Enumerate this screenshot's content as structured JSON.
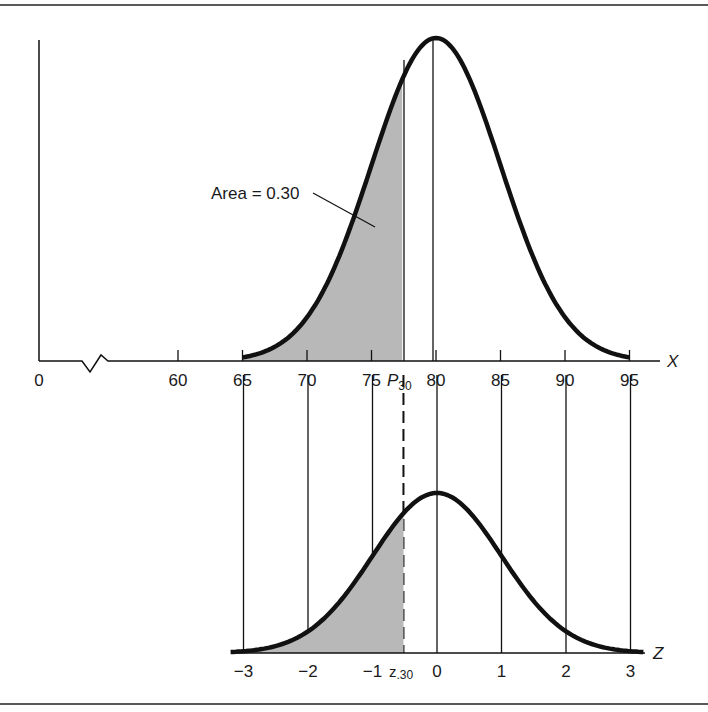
{
  "figure": {
    "annotation": "Area = 0.30",
    "upper_axis_label": "X",
    "lower_axis_label": "Z",
    "percentile_label_main": "P",
    "percentile_label_sub": "30",
    "z_label_main": "z",
    "z_label_sub": ".30",
    "shade_color": "#b8b8b8",
    "line_color": "#111111"
  },
  "chart_data": [
    {
      "type": "line",
      "title": "Normal distribution of X (mean 80, sd 5) with lower 30% shaded",
      "xlabel": "X",
      "ylabel": "",
      "x_ticks": [
        "0",
        "60",
        "65",
        "70",
        "75",
        "P30",
        "80",
        "85",
        "90",
        "95"
      ],
      "x_tick_values": [
        0,
        60,
        65,
        70,
        75,
        77.38,
        80,
        85,
        90,
        95
      ],
      "axis_break": true,
      "mean": 80,
      "sd": 5,
      "shaded_region": {
        "from": 65,
        "to": 77.38,
        "area": 0.3
      },
      "annotation": "Area = 0.30"
    },
    {
      "type": "line",
      "title": "Standard normal distribution of Z with lower 30% shaded",
      "xlabel": "Z",
      "ylabel": "",
      "x_ticks": [
        "-3",
        "-2",
        "-1",
        "z.30",
        "0",
        "1",
        "2",
        "3"
      ],
      "x_tick_values": [
        -3,
        -2,
        -1,
        -0.52,
        0,
        1,
        2,
        3
      ],
      "mean": 0,
      "sd": 1,
      "shaded_region": {
        "from": -3,
        "to": -0.52,
        "area": 0.3
      }
    }
  ]
}
